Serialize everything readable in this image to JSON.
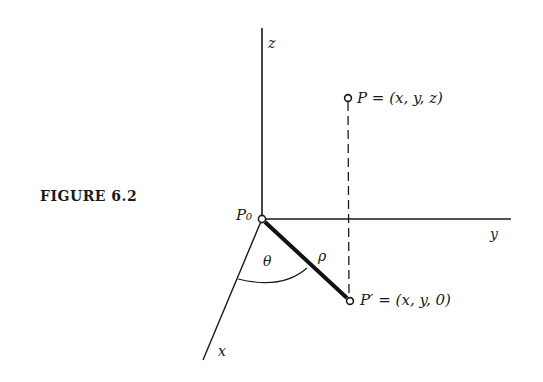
{
  "figure": {
    "caption": "FIGURE 6.2"
  },
  "axes": {
    "x_label": "x",
    "y_label": "y",
    "z_label": "z"
  },
  "points": {
    "origin": {
      "label": "P₀"
    },
    "p": {
      "label": "P = (x, y, z)"
    },
    "p_prime": {
      "label": "P′ = (x, y, 0)"
    }
  },
  "annotations": {
    "angle": "θ",
    "radius": "ρ"
  },
  "colors": {
    "ink": "#1a1a1a",
    "background": "#ffffff"
  }
}
